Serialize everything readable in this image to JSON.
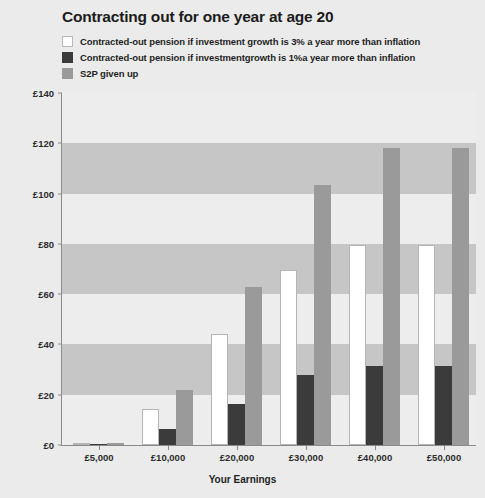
{
  "chart_data": {
    "type": "bar",
    "title": "Contracting out for one year at age 20",
    "xlabel": "Your Earnings",
    "ylabel": "Yearly pension",
    "categories": [
      "£5,000",
      "£10,000",
      "£20,000",
      "£30,000",
      "£40,000",
      "£50,000"
    ],
    "series": [
      {
        "name": "Contracted-out pension if investment growth is 3% a year more than inflation",
        "key": "white",
        "color": "#ffffff",
        "values": [
          0.6,
          14.3,
          44,
          69.5,
          79.5,
          79.5
        ]
      },
      {
        "name": "Contracted-out pension if investmentgrowth is 1%a year more than inflation",
        "key": "dark",
        "color": "#3b3b3b",
        "values": [
          0.4,
          6.3,
          16.3,
          27.8,
          31.5,
          31.5
        ]
      },
      {
        "name": "S2P given up",
        "key": "grey",
        "color": "#9a9a9a",
        "values": [
          0.8,
          22,
          63,
          103.5,
          118,
          118
        ]
      }
    ],
    "ylim": [
      0,
      140
    ],
    "yticks": [
      "£0",
      "£20",
      "£40",
      "£60",
      "£80",
      "£100",
      "£120",
      "£140"
    ],
    "ytick_values": [
      0,
      20,
      40,
      60,
      80,
      100,
      120,
      140
    ],
    "grid": false,
    "legend_position": "top-left",
    "bands": [
      [
        20,
        40
      ],
      [
        60,
        80
      ],
      [
        100,
        120
      ]
    ],
    "band_color": "#c6c6c6",
    "plot_background": "#ededed",
    "page_background": "#ebebeb"
  }
}
